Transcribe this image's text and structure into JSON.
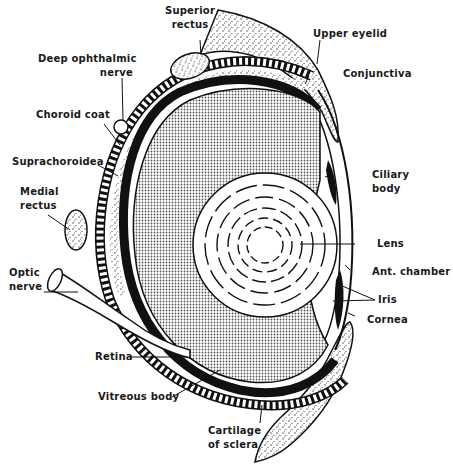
{
  "diagram": {
    "labels": {
      "superior_rectus": [
        "Superior",
        "rectus"
      ],
      "upper_eyelid": "Upper eyelid",
      "deep_ophthalmic_nerve": [
        "Deep ophthalmic",
        "nerve"
      ],
      "conjunctiva": "Conjunctiva",
      "choroid_coat": "Choroid coat",
      "suprachoroidea": "Suprachoroidea",
      "ciliary_body": [
        "Ciliary",
        "body"
      ],
      "medial_rectus": [
        "Medial",
        "rectus"
      ],
      "lens": "Lens",
      "optic_nerve": [
        "Optic",
        "nerve"
      ],
      "ant_chamber": "Ant. chamber",
      "iris": "Iris",
      "cornea": "Cornea",
      "retina": "Retina",
      "vitreous_body": "Vitreous body",
      "cartilage_of_sclera": [
        "Cartilage",
        "of sclera"
      ]
    },
    "colors": {
      "ink": "#111111",
      "vitreous_fill": "#9a9a9a",
      "stipple": "#777777",
      "background": "#ffffff"
    }
  }
}
